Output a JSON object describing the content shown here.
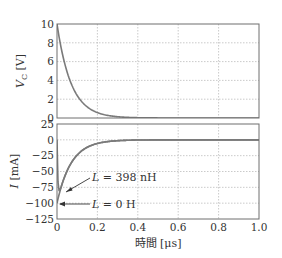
{
  "chart_data": [
    {
      "type": "line",
      "title": "",
      "xlabel": "",
      "ylabel": "V_C [V]",
      "xlim": [
        0,
        1.0
      ],
      "ylim": [
        0,
        10
      ],
      "xticks": [
        0,
        0.2,
        0.4,
        0.6,
        0.8,
        1.0
      ],
      "yticks": [
        0,
        2,
        4,
        6,
        8,
        10
      ],
      "ytick_labels": [
        "0",
        "2",
        "4",
        "6",
        "8",
        "10"
      ],
      "grid": true,
      "series": [
        {
          "name": "V_C",
          "x": [
            0,
            0.025,
            0.05,
            0.075,
            0.1,
            0.15,
            0.2,
            0.25,
            0.3,
            0.4,
            0.6,
            0.8,
            1.0
          ],
          "values": [
            10,
            7.0,
            4.9,
            3.4,
            2.4,
            1.2,
            0.57,
            0.28,
            0.14,
            0.03,
            0,
            0,
            0
          ]
        }
      ]
    },
    {
      "type": "line",
      "title": "",
      "xlabel": "時間 [μs]",
      "ylabel": "I [mA]",
      "xlim": [
        0,
        1.0
      ],
      "ylim": [
        -125,
        25
      ],
      "xticks": [
        0,
        0.2,
        0.4,
        0.6,
        0.8,
        1.0
      ],
      "xtick_labels": [
        "0",
        "0.2",
        "0.4",
        "0.6",
        "0.8",
        "1.0"
      ],
      "yticks": [
        25,
        0,
        -25,
        -50,
        -75,
        -100,
        -125
      ],
      "ytick_labels": [
        "25",
        "0",
        "−25",
        "−50",
        "−75",
        "−100",
        "−125"
      ],
      "grid": true,
      "series": [
        {
          "name": "L=0 H",
          "x": [
            0,
            0.025,
            0.05,
            0.075,
            0.1,
            0.15,
            0.2,
            0.25,
            0.3,
            0.4,
            0.6,
            0.8,
            1.0
          ],
          "values": [
            -100,
            -70,
            -49,
            -34,
            -24,
            -12,
            -5.7,
            -2.8,
            -1.4,
            -0.3,
            0,
            0,
            0
          ]
        },
        {
          "name": "L=398 nH",
          "x": [
            0,
            0.005,
            0.01,
            0.025,
            0.05,
            0.075,
            0.1,
            0.15,
            0.2,
            0.25,
            0.3,
            0.4,
            0.6,
            0.8,
            1.0
          ],
          "values": [
            0,
            -60,
            -92,
            -75,
            -52,
            -36,
            -25,
            -12,
            -6,
            -3,
            -1.5,
            -0.3,
            0,
            0,
            0
          ]
        }
      ],
      "annotations": [
        {
          "text": "L=398 nH",
          "points_to": [
            0.01,
            -85
          ]
        },
        {
          "text": "L=0 H",
          "points_to": [
            0.0,
            -100
          ]
        }
      ]
    }
  ],
  "labels": {
    "top_ylabel_main": "V",
    "top_ylabel_sub": "C",
    "top_ylabel_unit": " [V]",
    "bottom_ylabel_main": "I",
    "bottom_ylabel_unit": " [mA]",
    "xlabel": "時間 [μs]",
    "annot_398_L": "L",
    "annot_398_rest": " = 398 nH",
    "annot_0_L": "L",
    "annot_0_rest": " = 0 H"
  }
}
